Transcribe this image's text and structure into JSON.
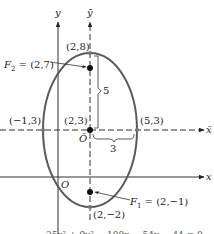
{
  "figure": {
    "axes": {
      "x_label": "x",
      "y_label": "y",
      "xbar_label": "x̄",
      "ybar_label": "ȳ",
      "origin_label": "O",
      "new_origin_label": "Ō"
    },
    "points": {
      "top_vertex": "(2,8)",
      "focus2_name": "F",
      "focus2_sub": "2",
      "focus2_value": " = (2,7)",
      "center": "(2,3)",
      "left_vertex": "(−1,3)",
      "right_vertex": "(5,3)",
      "focus1_name": "F",
      "focus1_sub": "1",
      "focus1_value": " = (2,−1)",
      "bottom_vertex": "(2,−2)"
    },
    "dimensions": {
      "semi_major": "5",
      "semi_minor": "3"
    },
    "equation": "25x² + 9y² − 100x − 54y − 44 = 0",
    "colors": {
      "ellipse": "#5a5a5a",
      "axes": "#333333",
      "dashed_axes": "#333333"
    }
  }
}
